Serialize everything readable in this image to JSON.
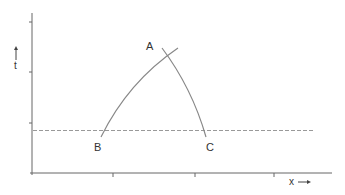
{
  "diagram": {
    "type": "space-time diagram",
    "labels": {
      "point_a": "A",
      "point_b": "B",
      "point_c": "C",
      "x_axis": "x",
      "t_axis": "t"
    },
    "axes": {
      "x": {
        "label": "x",
        "arrow": "right",
        "ticks": 3
      },
      "t": {
        "label": "t",
        "arrow": "up",
        "ticks": 3
      }
    },
    "elements": [
      {
        "id": "curve-BA",
        "from": "B",
        "to": "A",
        "style": "solid"
      },
      {
        "id": "curve-AC",
        "from": "A",
        "to": "C",
        "style": "solid"
      },
      {
        "id": "horizontal-reference",
        "style": "dashed"
      }
    ],
    "colors": {
      "axis": "#555555",
      "curve": "#888888",
      "dashed": "#999999",
      "text": "#333333"
    }
  }
}
